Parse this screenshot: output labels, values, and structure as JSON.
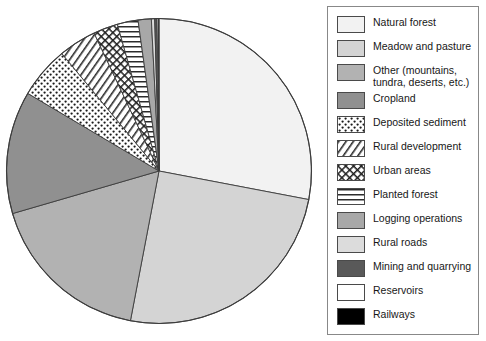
{
  "chart_data": {
    "type": "pie",
    "title": "",
    "total_label": "",
    "legend_position": "right",
    "start_angle_deg": 0,
    "direction": "clockwise",
    "categories": [
      "Natural forest",
      "Meadow and pasture",
      "Other (mountains, tundra, deserts, etc.)",
      "Cropland",
      "Deposited sediment",
      "Rural development",
      "Urban areas",
      "Planted forest",
      "Logging operations",
      "Rural roads",
      "Mining and quarrying",
      "Reservoirs",
      "Railways"
    ],
    "values": [
      28.0,
      25.0,
      17.5,
      13.0,
      5.5,
      4.0,
      2.6,
      2.2,
      1.4,
      0.35,
      0.25,
      0.15,
      0.05
    ],
    "units": "percent",
    "slices": [
      {
        "label": "Natural forest",
        "value": 28.0,
        "fill": "#f2f2f2",
        "pattern": "solid"
      },
      {
        "label": "Meadow and pasture",
        "value": 25.0,
        "fill": "#d4d4d4",
        "pattern": "solid"
      },
      {
        "label": "Other (mountains, tundra, deserts, etc.)",
        "value": 17.5,
        "fill": "#b2b2b2",
        "pattern": "solid"
      },
      {
        "label": "Cropland",
        "value": 13.0,
        "fill": "#909090",
        "pattern": "solid"
      },
      {
        "label": "Deposited sediment",
        "value": 5.5,
        "fill": "#ffffff",
        "pattern": "dots"
      },
      {
        "label": "Rural development",
        "value": 4.0,
        "fill": "#ffffff",
        "pattern": "diagonal"
      },
      {
        "label": "Urban areas",
        "value": 2.6,
        "fill": "#ffffff",
        "pattern": "crosshatch"
      },
      {
        "label": "Planted forest",
        "value": 2.2,
        "fill": "#ffffff",
        "pattern": "horizontal"
      },
      {
        "label": "Logging operations",
        "value": 1.4,
        "fill": "#a8a8a8",
        "pattern": "solid"
      },
      {
        "label": "Rural roads",
        "value": 0.35,
        "fill": "#dcdcdc",
        "pattern": "solid"
      },
      {
        "label": "Mining and quarrying",
        "value": 0.25,
        "fill": "#595959",
        "pattern": "solid"
      },
      {
        "label": "Reservoirs",
        "value": 0.15,
        "fill": "#ffffff",
        "pattern": "solid"
      },
      {
        "label": "Railways",
        "value": 0.05,
        "fill": "#000000",
        "pattern": "solid"
      }
    ]
  },
  "legend": {
    "items": [
      {
        "label": "Natural forest",
        "swatch": "swatch-natural-forest",
        "color": "#f2f2f2",
        "pattern": "solid"
      },
      {
        "label": "Meadow and pasture",
        "swatch": "swatch-meadow-pasture",
        "color": "#d4d4d4",
        "pattern": "solid"
      },
      {
        "label": "Other (mountains,\ntundra, deserts, etc.)",
        "swatch": "swatch-other",
        "color": "#b2b2b2",
        "pattern": "solid"
      },
      {
        "label": "Cropland",
        "swatch": "swatch-cropland",
        "color": "#909090",
        "pattern": "solid"
      },
      {
        "label": "Deposited sediment",
        "swatch": "swatch-deposited-sediment",
        "color": "#ffffff",
        "pattern": "dots"
      },
      {
        "label": "Rural development",
        "swatch": "swatch-rural-development",
        "color": "#ffffff",
        "pattern": "diagonal"
      },
      {
        "label": "Urban areas",
        "swatch": "swatch-urban-areas",
        "color": "#ffffff",
        "pattern": "crosshatch"
      },
      {
        "label": "Planted forest",
        "swatch": "swatch-planted-forest",
        "color": "#ffffff",
        "pattern": "horizontal"
      },
      {
        "label": "Logging operations",
        "swatch": "swatch-logging-operations",
        "color": "#a8a8a8",
        "pattern": "solid"
      },
      {
        "label": "Rural roads",
        "swatch": "swatch-rural-roads",
        "color": "#dcdcdc",
        "pattern": "solid"
      },
      {
        "label": "Mining and quarrying",
        "swatch": "swatch-mining-quarrying",
        "color": "#595959",
        "pattern": "solid"
      },
      {
        "label": "Reservoirs",
        "swatch": "swatch-reservoirs",
        "color": "#ffffff",
        "pattern": "solid"
      },
      {
        "label": "Railways",
        "swatch": "swatch-railways",
        "color": "#000000",
        "pattern": "solid"
      }
    ]
  },
  "style": {
    "stroke": "#3c3c3c",
    "legend_border": "#888888",
    "text_color": "#171717",
    "background": "#ffffff"
  }
}
